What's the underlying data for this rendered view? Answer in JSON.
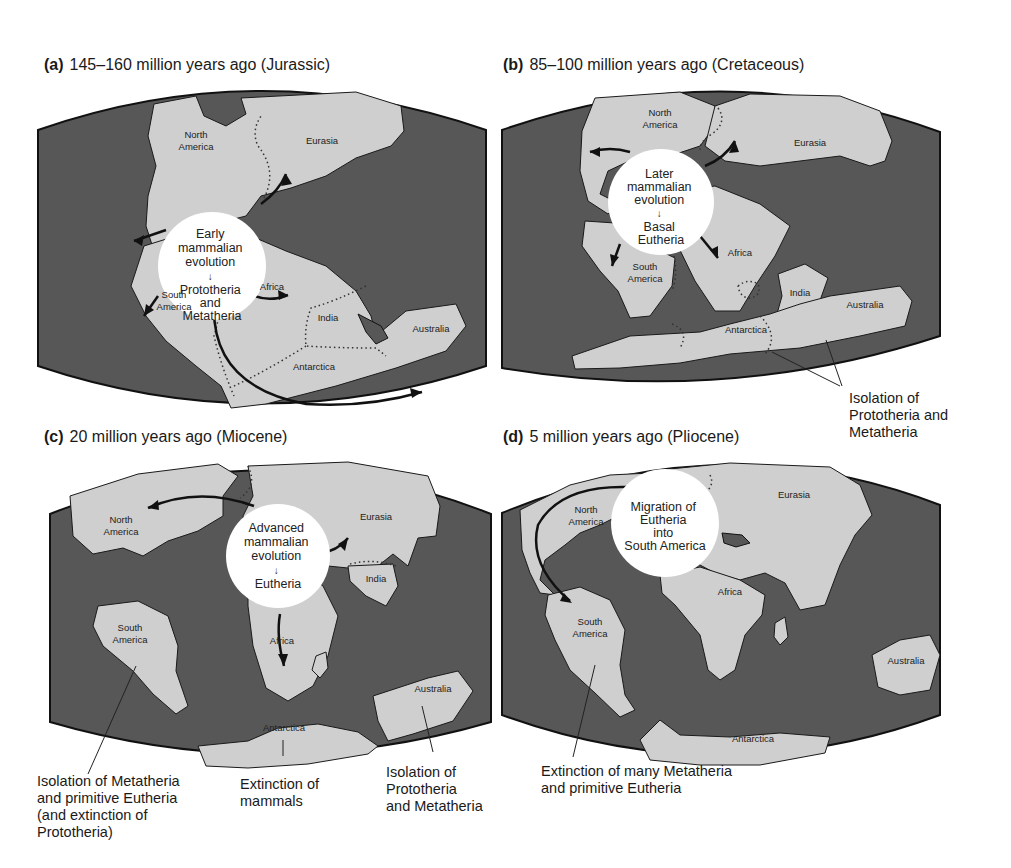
{
  "panels": [
    {
      "id": "a",
      "letter": "(a)",
      "title": "145–160 million years ago (Jurassic)",
      "circle_lines": [
        "Early",
        "mammalian",
        "evolution",
        "↓",
        "Prototheria",
        "and",
        "Metatheria"
      ],
      "labels": {
        "north_america": [
          "North",
          "America"
        ],
        "eurasia": "Eurasia",
        "south_america": [
          "South",
          "America"
        ],
        "africa": "Africa",
        "india": "India",
        "australia": "Australia",
        "antarctica": "Antarctica"
      },
      "annotations": []
    },
    {
      "id": "b",
      "letter": "(b)",
      "title": "85–100 million years ago (Cretaceous)",
      "circle_lines": [
        "Later",
        "mammalian",
        "evolution",
        "↓",
        "Basal",
        "Eutheria"
      ],
      "labels": {
        "north_america": [
          "North",
          "America"
        ],
        "eurasia": "Eurasia",
        "south_america": [
          "South",
          "America"
        ],
        "africa": "Africa",
        "india": "India",
        "australia": "Australia",
        "antarctica": "Antarctica"
      },
      "annotations": [
        {
          "lines": [
            "Isolation of",
            "Prototheria and",
            "Metatheria"
          ]
        }
      ]
    },
    {
      "id": "c",
      "letter": "(c)",
      "title": "20 million years ago (Miocene)",
      "circle_lines": [
        "Advanced",
        "mammalian",
        "evolution",
        "↓",
        "Eutheria"
      ],
      "labels": {
        "north_america": [
          "North",
          "America"
        ],
        "eurasia": "Eurasia",
        "south_america": [
          "South",
          "America"
        ],
        "africa": "Africa",
        "india": "India",
        "australia": "Australia",
        "antarctica": "Antarctica"
      },
      "annotations": [
        {
          "lines": [
            "Isolation of Metatheria",
            "and primitive Eutheria",
            "(and extinction of",
            "Prototheria)"
          ]
        },
        {
          "lines": [
            "Extinction of",
            "mammals"
          ]
        },
        {
          "lines": [
            "Isolation of",
            "Prototheria",
            "and Metatheria"
          ]
        }
      ]
    },
    {
      "id": "d",
      "letter": "(d)",
      "title": "5 million years ago (Pliocene)",
      "circle_lines": [
        "Migration of",
        "Eutheria",
        "into",
        "South America"
      ],
      "labels": {
        "north_america": [
          "North",
          "America"
        ],
        "eurasia": "Eurasia",
        "south_america": [
          "South",
          "America"
        ],
        "africa": "Africa",
        "australia": "Australia",
        "antarctica": "Antarctica"
      },
      "annotations": [
        {
          "lines": [
            "Extinction of many Metatheria",
            "and primitive Eutheria"
          ]
        }
      ]
    }
  ],
  "colors": {
    "ocean": "#575757",
    "land": "#cfcfcf",
    "circle": "#ffffff"
  }
}
